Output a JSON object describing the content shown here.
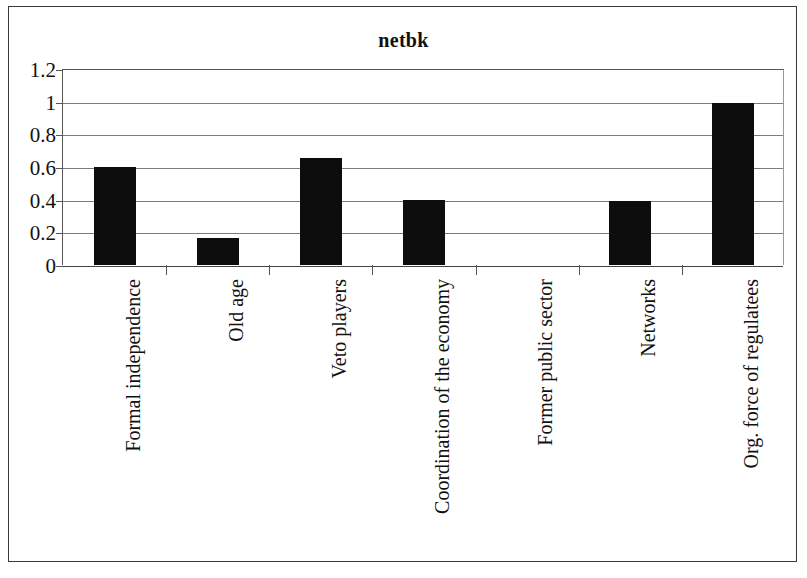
{
  "chart_data": {
    "type": "bar",
    "title": "netbk",
    "xlabel": "",
    "ylabel": "",
    "categories": [
      "Formal independence",
      "Old age",
      "Veto players",
      "Coordination of the economy",
      "Former public sector",
      "Networks",
      "Org. force of regulatees"
    ],
    "values": [
      0.6,
      0.165,
      0.655,
      0.4,
      0,
      0.39,
      0.99
    ],
    "ylim": [
      0,
      1.2
    ],
    "ytick_values": [
      1.2,
      1,
      0.8,
      0.6,
      0.4,
      0.2,
      0
    ],
    "ytick_labels": [
      "1.2",
      "1",
      "0.8",
      "0.6",
      "0.4",
      "0.2",
      "0"
    ],
    "grid": true,
    "grid_axis": "y",
    "legend": false,
    "legend_position": "none",
    "bar_color": "#0d0d0d",
    "gridline_color": "#7c7c7c",
    "axis_color": "#555555",
    "background_color": "#ffffff",
    "border_color": "#3a3a3a",
    "series": [
      {
        "name": "netbk",
        "values": [
          0.6,
          0.165,
          0.655,
          0.4,
          0,
          0.39,
          0.99
        ]
      }
    ]
  }
}
